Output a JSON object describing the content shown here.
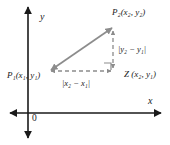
{
  "figure": {
    "background_color": "#ffffff",
    "axis_color": "#1a1a1a",
    "segment_color": "#8c8c8c",
    "text_color": "#1a1a1a"
  },
  "axes": {
    "x_label": "x",
    "y_label": "y",
    "origin_label": "0"
  },
  "points": [
    {
      "id": "P2",
      "label": "P₂(x₂, y₂)",
      "name": "P",
      "subscript": "2",
      "coords": "(x₂, y₂)",
      "px": 113,
      "py": 27
    },
    {
      "id": "P1",
      "label": "P₁(x₁, y₁)",
      "name": "P",
      "subscript": "1",
      "coords": "(x₁, y₁)",
      "px": 50,
      "py": 71
    },
    {
      "id": "Z",
      "label": "Z (x₂, y₁)",
      "name": "Z",
      "subscript": "",
      "coords": "(x₂, y₁)",
      "px": 113,
      "py": 71
    }
  ],
  "segments": [
    {
      "id": "hypotenuse",
      "from": "P1",
      "to": "P2",
      "style": "solid",
      "arrows": "both",
      "label": ""
    },
    {
      "id": "vertical-leg",
      "from": "P2",
      "to": "Z",
      "style": "dashed",
      "arrows": "both",
      "label": "|y₂ − y₁|"
    },
    {
      "id": "horizontal-leg",
      "from": "Z",
      "to": "P1",
      "style": "dashed",
      "arrows": "both",
      "label": "|x₂ − x₁|"
    }
  ],
  "markers": {
    "right_angle_at": "Z"
  },
  "labels": {
    "vertical_distance": "|y₂ − y₁|",
    "horizontal_distance": "|x₂ − x₁|",
    "p2": "P₂(x₂, y₂)",
    "p1": "P₁(x₁, y₁)",
    "z": "Z (x₂, y₁)"
  }
}
